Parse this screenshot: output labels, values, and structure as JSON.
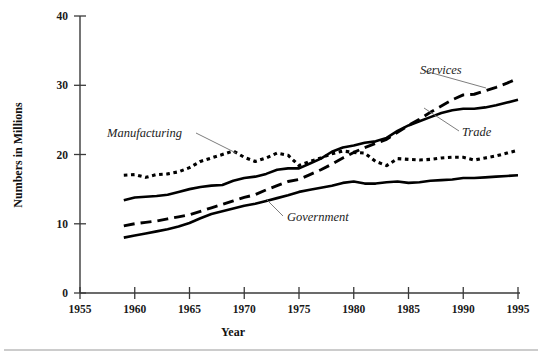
{
  "chart_data": {
    "type": "line",
    "title": "",
    "xlabel": "Year",
    "ylabel": "Numbers in Millions",
    "xlim": [
      1955,
      1995
    ],
    "ylim": [
      0,
      40
    ],
    "xticks": [
      1955,
      1960,
      1965,
      1970,
      1975,
      1980,
      1985,
      1990,
      1995
    ],
    "xtick_labels": [
      "1955",
      "1960",
      "1965",
      "1970",
      "1975",
      "1980",
      "1985",
      "1990",
      "1995"
    ],
    "yticks": [
      0,
      10,
      20,
      30,
      40
    ],
    "ytick_labels": [
      "0",
      "10",
      "20",
      "30",
      "40"
    ],
    "grid": false,
    "legend_position": "inline-annotations",
    "x": [
      1959,
      1960,
      1961,
      1962,
      1963,
      1964,
      1965,
      1966,
      1967,
      1968,
      1969,
      1970,
      1971,
      1972,
      1973,
      1974,
      1975,
      1976,
      1977,
      1978,
      1979,
      1980,
      1981,
      1982,
      1983,
      1984,
      1985,
      1986,
      1987,
      1988,
      1989,
      1990,
      1991,
      1992,
      1993,
      1994,
      1995
    ],
    "series": [
      {
        "name": "Manufacturing",
        "style": "dotted",
        "label_anchor_year": 1969,
        "values": [
          17.0,
          17.1,
          16.7,
          17.1,
          17.2,
          17.5,
          18.1,
          19.0,
          19.5,
          20.0,
          20.5,
          19.6,
          19.0,
          19.5,
          20.2,
          19.9,
          18.4,
          19.0,
          19.5,
          20.1,
          20.5,
          20.3,
          20.2,
          19.0,
          18.4,
          19.4,
          19.3,
          19.2,
          19.3,
          19.5,
          19.6,
          19.6,
          19.2,
          19.5,
          19.8,
          20.2,
          20.6
        ]
      },
      {
        "name": "Trade",
        "style": "solid",
        "label_anchor_year": 1989,
        "values": [
          13.4,
          13.8,
          13.9,
          14.0,
          14.2,
          14.6,
          15.0,
          15.3,
          15.5,
          15.6,
          16.2,
          16.6,
          16.8,
          17.2,
          17.8,
          18.0,
          18.0,
          18.7,
          19.4,
          20.4,
          21.0,
          21.3,
          21.7,
          21.9,
          22.4,
          23.4,
          24.2,
          24.8,
          25.4,
          26.0,
          26.4,
          26.6,
          26.6,
          26.8,
          27.1,
          27.5,
          27.9
        ]
      },
      {
        "name": "Services",
        "style": "dashed",
        "label_anchor_year": 1991,
        "values": [
          9.7,
          10.0,
          10.2,
          10.4,
          10.7,
          11.0,
          11.3,
          11.8,
          12.3,
          12.8,
          13.3,
          13.8,
          14.2,
          14.9,
          15.5,
          16.1,
          16.4,
          17.1,
          17.8,
          18.6,
          19.5,
          20.3,
          21.0,
          21.6,
          22.2,
          23.2,
          24.2,
          25.1,
          26.1,
          27.0,
          27.9,
          28.6,
          28.7,
          29.2,
          29.7,
          30.3,
          31.0
        ]
      },
      {
        "name": "Government",
        "style": "solid",
        "label_anchor_year": 1975,
        "values": [
          8.0,
          8.3,
          8.6,
          8.9,
          9.2,
          9.6,
          10.1,
          10.8,
          11.4,
          11.8,
          12.2,
          12.6,
          12.9,
          13.3,
          13.7,
          14.1,
          14.6,
          14.9,
          15.2,
          15.5,
          15.9,
          16.1,
          15.8,
          15.8,
          16.0,
          16.1,
          15.9,
          16.0,
          16.2,
          16.3,
          16.4,
          16.6,
          16.6,
          16.7,
          16.8,
          16.9,
          17.0
        ]
      }
    ],
    "annotations": [
      {
        "text": "Manufacturing",
        "kind": "series-label"
      },
      {
        "text": "Services",
        "kind": "series-label"
      },
      {
        "text": "Trade",
        "kind": "series-label"
      },
      {
        "text": "Government",
        "kind": "series-label"
      }
    ]
  },
  "labels": {
    "manufacturing": "Manufacturing",
    "services": "Services",
    "trade": "Trade",
    "government": "Government",
    "ylabel": "Numbers in Millions",
    "xlabel": "Year"
  },
  "colors": {
    "line": "#000000",
    "axis": "#3a3a3a",
    "rule": "#9a9a9a",
    "background": "#ffffff"
  }
}
